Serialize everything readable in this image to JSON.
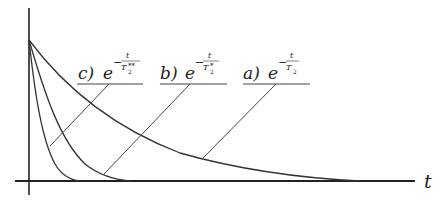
{
  "diagram": {
    "axis": {
      "x_label": "t"
    },
    "curves": [
      {
        "id": "a",
        "label_prefix": "a)",
        "base": "e",
        "exponent_numerator": "t",
        "exponent_denominator": "T",
        "denominator_subscript": "2",
        "denominator_superscript": ""
      },
      {
        "id": "b",
        "label_prefix": "b)",
        "base": "e",
        "exponent_numerator": "t",
        "exponent_denominator": "T",
        "denominator_subscript": "2",
        "denominator_superscript": "*"
      },
      {
        "id": "c",
        "label_prefix": "c)",
        "base": "e",
        "exponent_numerator": "t",
        "exponent_denominator": "T",
        "denominator_subscript": "2",
        "denominator_superscript": "**"
      }
    ],
    "minus_sign": "−",
    "colors": {
      "line": "#333333",
      "axis": "#222222",
      "background": "#ffffff"
    }
  }
}
